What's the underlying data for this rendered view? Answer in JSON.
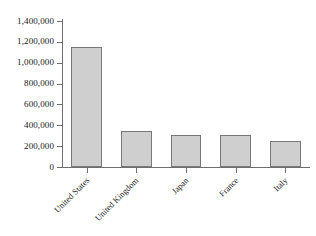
{
  "chart_data": {
    "type": "bar",
    "title": "",
    "subtitle": "",
    "xlabel": "",
    "ylabel": "",
    "categories": [
      "United States",
      "United Kingdom",
      "Japan",
      "France",
      "Italy"
    ],
    "values": [
      1150000,
      345000,
      310000,
      305000,
      250000
    ],
    "ylim": [
      0,
      1400000
    ],
    "ytick_values": [
      0,
      200000,
      400000,
      600000,
      800000,
      1000000,
      1200000,
      1400000
    ],
    "ytick_labels": [
      "0",
      "200,000",
      "400,000",
      "600,000",
      "800,000",
      "1,000,000",
      "1,200,000",
      "1,400,000"
    ],
    "grid": false,
    "legend": null,
    "bar_fill_color": "#cfcfcf",
    "bar_border_color": "#787878",
    "axis_color": "#6e6e6e",
    "background_color": "#ffffff",
    "category_label_rotation": -45
  }
}
